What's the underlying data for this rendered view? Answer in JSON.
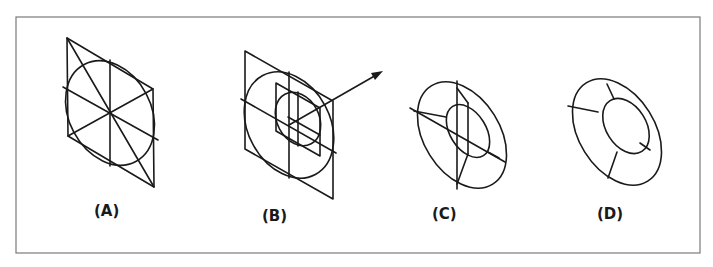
{
  "figure": {
    "type": "technical-illustration",
    "colors": {
      "line": "#1a1a1a",
      "frame": "#7a7a7a",
      "background": "#ffffff"
    },
    "panels": [
      {
        "id": "A",
        "label": "(A)",
        "content": "Rhombus with inscribed ellipse, center lines and diagonals"
      },
      {
        "id": "B",
        "label": "(B)",
        "content": "Outer and inner rhombi with ellipses and projection arrow"
      },
      {
        "id": "C",
        "label": "(C)",
        "content": "Concentric ellipses with tangent construction lines"
      },
      {
        "id": "D",
        "label": "(D)",
        "content": "Finished ring segmented into four parts"
      }
    ]
  }
}
